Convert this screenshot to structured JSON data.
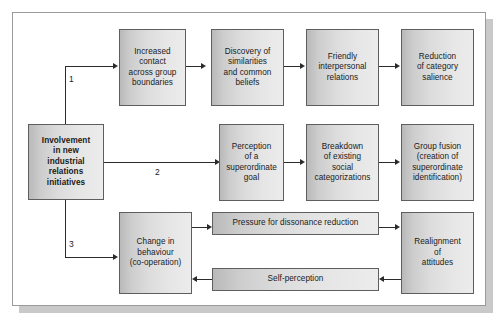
{
  "diagram": {
    "source_box": {
      "id": "involvement",
      "lines": [
        "Involvement",
        "in new",
        "industrial",
        "relations",
        "initiatives"
      ],
      "text": "Involvement in new industrial relations initiatives",
      "bold": true
    },
    "branch_labels": [
      "1",
      "2",
      "3"
    ],
    "paths": [
      {
        "number": "1",
        "boxes": [
          {
            "id": "increased-contact",
            "lines": [
              "Increased",
              "contact",
              "across group",
              "boundaries"
            ],
            "text": "Increased contact across group boundaries"
          },
          {
            "id": "discovery-similarities",
            "lines": [
              "Discovery of",
              "similarities",
              "and common",
              "beliefs"
            ],
            "text": "Discovery of similarities and common beliefs"
          },
          {
            "id": "friendly-relations",
            "lines": [
              "Friendly",
              "interpersonal",
              "relations"
            ],
            "text": "Friendly interpersonal relations"
          },
          {
            "id": "reduction-salience",
            "lines": [
              "Reduction",
              "of category",
              "salience"
            ],
            "text": "Reduction of category salience"
          }
        ]
      },
      {
        "number": "2",
        "boxes": [
          {
            "id": "perception-goal",
            "lines": [
              "Perception",
              "of a",
              "superordinate",
              "goal"
            ],
            "text": "Perception of a superordinate goal"
          },
          {
            "id": "breakdown-categorizations",
            "lines": [
              "Breakdown",
              "of existing",
              "social",
              "categorizations"
            ],
            "text": "Breakdown of existing social categorizations"
          },
          {
            "id": "group-fusion",
            "lines": [
              "Group fusion",
              "(creation of",
              "superordinate",
              "identification)"
            ],
            "text": "Group fusion (creation of superordinate identification)"
          }
        ]
      },
      {
        "number": "3",
        "boxes": [
          {
            "id": "change-behaviour",
            "lines": [
              "Change in",
              "behaviour",
              "(co-operation)"
            ],
            "text": "Change in behaviour (co-operation)"
          },
          {
            "id": "pressure-dissonance",
            "lines": [
              "Pressure for dissonance reduction"
            ],
            "text": "Pressure for dissonance reduction"
          },
          {
            "id": "realignment-attitudes",
            "lines": [
              "Realignment",
              "of",
              "attitudes"
            ],
            "text": "Realignment of attitudes"
          },
          {
            "id": "self-perception",
            "lines": [
              "Self-perception"
            ],
            "text": "Self-perception"
          }
        ]
      }
    ],
    "colors": {
      "box_fill_dark": "#b9b9b9",
      "box_fill_light": "#ececec",
      "box_border": "#5e5e5e",
      "line": "#2b2b2b",
      "frame_border": "#9a9a9a",
      "shadow": "#c9c9c9",
      "page_background": "#ffffff"
    }
  }
}
